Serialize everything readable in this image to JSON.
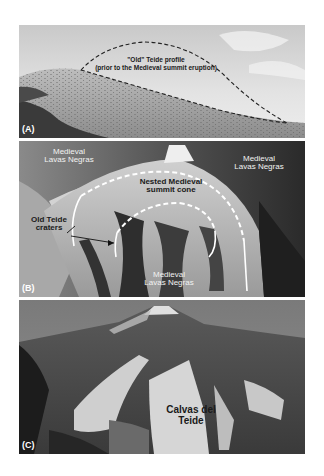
{
  "figure": {
    "panels": [
      {
        "tag": "(A)",
        "labels": {
          "profile_line1": "\"Old\" Teide profile",
          "profile_line2": "(prior to the Medieval summit eruption)"
        }
      },
      {
        "tag": "(B)",
        "labels": {
          "upper_left_line1": "Medieval",
          "upper_left_line2": "Lavas Negras",
          "upper_right_line1": "Medieval",
          "upper_right_line2": "Lavas Negras",
          "cone_line1": "Nested Medieval",
          "cone_line2": "summit cone",
          "craters_line1": "Old Teide",
          "craters_line2": "craters",
          "bottom_line1": "Medieval",
          "bottom_line2": "Lavas Negras"
        }
      },
      {
        "tag": "(C)",
        "labels": {
          "calvas_line1": "Calvas del",
          "calvas_line2": "Teide"
        }
      }
    ]
  }
}
